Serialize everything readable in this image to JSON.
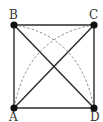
{
  "diagram": {
    "colors": {
      "line": "#2a2a2a",
      "dashed": "#8a8a8a",
      "point": "#111111",
      "background": "#ffffff"
    },
    "points": {
      "A": {
        "label": "A",
        "x": 14,
        "y": 108
      },
      "B": {
        "label": "B",
        "x": 14,
        "y": 25
      },
      "C": {
        "label": "C",
        "x": 94,
        "y": 25
      },
      "D": {
        "label": "D",
        "x": 94,
        "y": 108
      }
    },
    "segments": [
      "AB",
      "BC",
      "CD",
      "DA",
      "AC",
      "BD"
    ],
    "arcs": [
      {
        "from": "B",
        "to": "D",
        "center": "A",
        "style": "dashed"
      },
      {
        "from": "A",
        "to": "C",
        "center": "D",
        "style": "dashed"
      }
    ]
  }
}
